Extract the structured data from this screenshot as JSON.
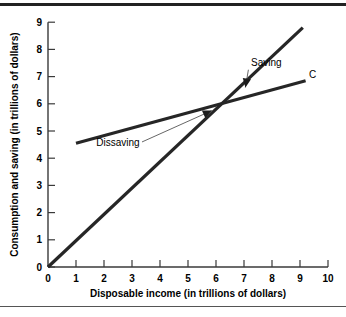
{
  "chart_data": {
    "type": "line",
    "title": "",
    "xlabel": "Disposable income (in trillions of dollars)",
    "ylabel": "Consumption and saving (in trillions of dollars)",
    "xlim": [
      0,
      10
    ],
    "ylim": [
      0,
      9
    ],
    "xticks": [
      "0",
      "1",
      "2",
      "3",
      "4",
      "5",
      "6",
      "7",
      "8",
      "9",
      "10"
    ],
    "yticks": [
      "0",
      "1",
      "2",
      "3",
      "4",
      "5",
      "6",
      "7",
      "8",
      "9"
    ],
    "grid": false,
    "legend": "none",
    "series": [
      {
        "name": "45-degree line",
        "label": "",
        "x": [
          0,
          9.1
        ],
        "y": [
          0,
          8.8
        ]
      },
      {
        "name": "C",
        "label": "C",
        "x": [
          1.0,
          9.2
        ],
        "y": [
          4.55,
          6.85
        ]
      }
    ],
    "annotations": [
      {
        "name": "saving",
        "text": "Saving",
        "label_x": 7.8,
        "label_y": 7.4,
        "target_x": 7.05,
        "target_y": 6.6
      },
      {
        "name": "dissaving",
        "text": "Dissaving",
        "label_x": 2.5,
        "label_y": 4.45,
        "target_x": 5.85,
        "target_y": 5.75
      },
      {
        "name": "consumption-line-label",
        "text": "C",
        "label_x": 9.45,
        "label_y": 6.95
      }
    ],
    "intersection": {
      "x": 6.35,
      "y": 6.1
    },
    "colors": {
      "line": "#262626",
      "axis": "#3a3a3a",
      "background": "#ffffff",
      "rule": "#222222"
    }
  }
}
